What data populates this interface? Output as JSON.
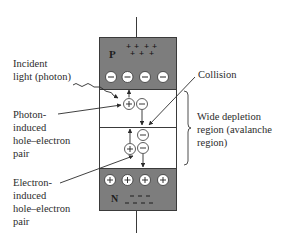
{
  "diagram": {
    "regions": {
      "p": {
        "label": "P",
        "charges": "+ + + + + + +",
        "fill": "#7d7d7d"
      },
      "depletion": {
        "fill": "#ffffff"
      },
      "n": {
        "label": "N",
        "charges": "− − − − − − −",
        "fill": "#7d7d7d"
      }
    },
    "labels": {
      "incident_line1": "Incident",
      "incident_line2": "light (photon)",
      "photon_line1": "Photon-",
      "photon_line2": "induced",
      "photon_line3": "hole–electron",
      "photon_line4": "pair",
      "electron_line1": "Electron-",
      "electron_line2": "induced",
      "electron_line3": "hole–electron",
      "electron_line4": "pair",
      "collision": "Collision",
      "wide_line1": "Wide depletion",
      "wide_line2": "region (avalanche",
      "wide_line3": "region)"
    },
    "symbols": {
      "plus": "+",
      "minus": "−",
      "p_letter": "P",
      "n_letter": "N"
    },
    "colors": {
      "semiconductor_gray": "#7d7d7d",
      "line": "#3a3a3a",
      "text": "#2b2b2b"
    }
  }
}
